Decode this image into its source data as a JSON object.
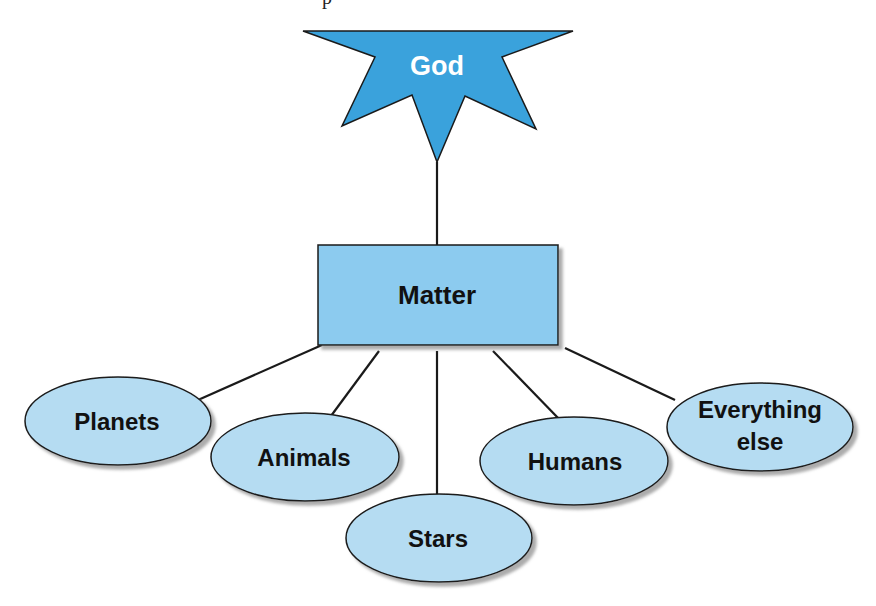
{
  "diagram": {
    "partial_top_text": "p",
    "root": {
      "label": "God",
      "shape": "star",
      "fill": "#3aa2dc",
      "text_color": "#ffffff"
    },
    "middle": {
      "label": "Matter",
      "shape": "rectangle",
      "fill": "#8ccbef",
      "text_color": "#111111"
    },
    "children": [
      {
        "label": "Planets",
        "shape": "ellipse"
      },
      {
        "label": "Animals",
        "shape": "ellipse"
      },
      {
        "label": "Stars",
        "shape": "ellipse"
      },
      {
        "label": "Humans",
        "shape": "ellipse"
      },
      {
        "label_line1": "Everything",
        "label_line2": "else",
        "shape": "ellipse"
      }
    ],
    "colors": {
      "ellipse_fill": "#b5dcf2",
      "stroke": "#1a1a1a",
      "shadow": "#9a9a9a"
    }
  }
}
